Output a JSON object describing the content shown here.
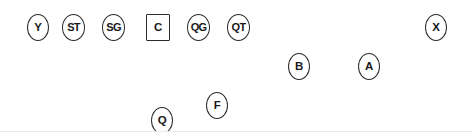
{
  "diagram": {
    "background_color": "#ffffff",
    "marker_stroke_color": "#2b2b2b",
    "label_color": "#1a1a1a",
    "width": 472,
    "height": 132
  },
  "players": [
    {
      "label": "Y",
      "shape": "oval",
      "x": 27,
      "y": 14,
      "w": 22,
      "h": 27
    },
    {
      "label": "ST",
      "shape": "oval",
      "x": 62,
      "y": 14,
      "w": 23,
      "h": 27
    },
    {
      "label": "SG",
      "shape": "oval",
      "x": 102,
      "y": 14,
      "w": 23,
      "h": 27
    },
    {
      "label": "C",
      "shape": "box",
      "x": 146,
      "y": 14,
      "w": 24,
      "h": 27
    },
    {
      "label": "QG",
      "shape": "oval",
      "x": 187,
      "y": 14,
      "w": 23,
      "h": 27
    },
    {
      "label": "QT",
      "shape": "oval",
      "x": 227,
      "y": 14,
      "w": 23,
      "h": 27
    },
    {
      "label": "X",
      "shape": "oval",
      "x": 425,
      "y": 14,
      "w": 22,
      "h": 27
    },
    {
      "label": "B",
      "shape": "oval",
      "x": 288,
      "y": 53,
      "w": 22,
      "h": 27
    },
    {
      "label": "A",
      "shape": "oval",
      "x": 358,
      "y": 53,
      "w": 22,
      "h": 27
    },
    {
      "label": "F",
      "shape": "oval",
      "x": 206,
      "y": 92,
      "w": 22,
      "h": 27
    },
    {
      "label": "Q",
      "shape": "oval",
      "x": 151,
      "y": 107,
      "w": 22,
      "h": 27
    }
  ]
}
